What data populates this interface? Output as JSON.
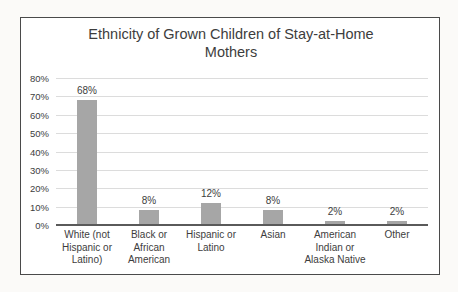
{
  "chart": {
    "colors": {
      "bar": "#a6a6a6",
      "gridline": "#dcdcdc",
      "axis_line": "#5a5a5a",
      "text": "#3d3d3d",
      "frame_border": "#4a4a4a",
      "frame_background": "#ffffff",
      "page_background": "#fbfaf8"
    }
  },
  "chart_data": {
    "type": "bar",
    "title": "Ethnicity of Grown Children of Stay-at-Home Mothers",
    "categories": [
      "White (not Hispanic or Latino)",
      "Black or African American",
      "Hispanic or Latino",
      "Asian",
      "American Indian or Alaska Native",
      "Other"
    ],
    "values": [
      68,
      8,
      12,
      8,
      2,
      2
    ],
    "data_labels": [
      "68%",
      "8%",
      "12%",
      "8%",
      "2%",
      "2%"
    ],
    "xlabel": "",
    "ylabel": "",
    "ylim": [
      0,
      80
    ],
    "ytick_step": 10,
    "ytick_labels": [
      "0%",
      "10%",
      "20%",
      "30%",
      "40%",
      "50%",
      "60%",
      "70%",
      "80%"
    ],
    "grid": true,
    "legend": false
  }
}
